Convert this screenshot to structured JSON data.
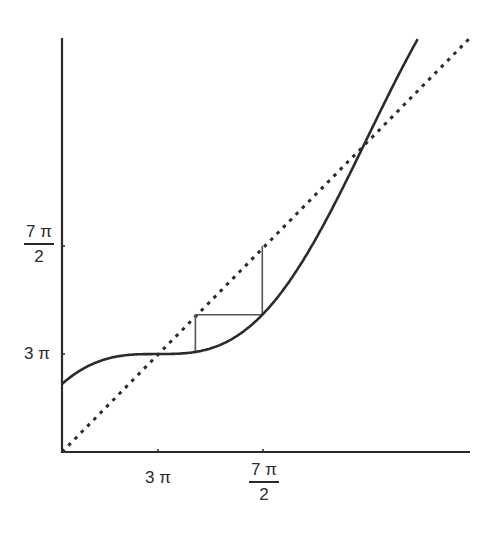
{
  "chart_data": {
    "type": "line",
    "title": "",
    "xlabel": "",
    "ylabel": "",
    "xlim": [
      8.0,
      14.1
    ],
    "ylim": [
      8.0,
      14.0
    ],
    "grid": false,
    "legend": null,
    "x_ticks": [
      {
        "value": 9.42478,
        "label": "3 π"
      },
      {
        "value": 10.99557,
        "label_num": "7 π",
        "label_den": "2"
      }
    ],
    "y_ticks": [
      {
        "value": 9.42478,
        "label": "3 π"
      },
      {
        "value": 10.99557,
        "label_num": "7 π",
        "label_den": "2"
      }
    ],
    "series": [
      {
        "name": "f(x) = x + sin x",
        "style": "solid",
        "color": "#2b2b2b",
        "x": [
          8.0,
          8.5,
          9.0,
          9.42478,
          10.0,
          10.5,
          10.99557,
          11.5,
          12.0,
          12.566,
          13.0,
          13.5,
          13.9
        ],
        "y": [
          8.989,
          9.298,
          9.412,
          9.42478,
          9.456,
          9.62,
          9.996,
          10.625,
          11.463,
          12.566,
          13.42,
          14.304,
          14.9
        ]
      },
      {
        "name": "y = x",
        "style": "dotted",
        "color": "#2b2b2b",
        "x": [
          8.0,
          14.1
        ],
        "y": [
          8.0,
          14.1
        ]
      },
      {
        "name": "cobweb",
        "style": "solid-thin",
        "color": "#555555",
        "x": [
          9.996,
          9.996,
          10.99557,
          10.99557
        ],
        "y": [
          9.456,
          9.996,
          9.996,
          10.99557
        ]
      }
    ]
  },
  "labels": {
    "x_tick_1": "3 π",
    "x_tick_2_num": "7 π",
    "x_tick_2_den": "2",
    "y_tick_1": "3 π",
    "y_tick_2_num": "7 π",
    "y_tick_2_den": "2"
  }
}
